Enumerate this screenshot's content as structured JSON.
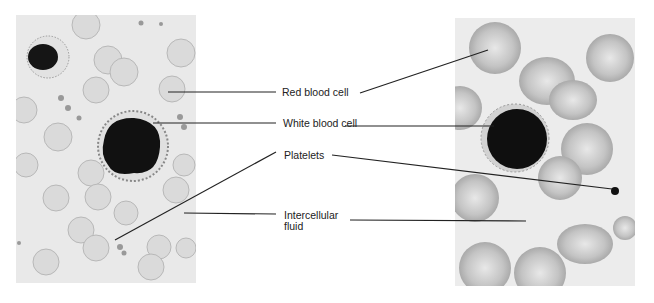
{
  "figure": {
    "left_panel": {
      "description": "Illustration of blood smear: red blood cells, white blood cell, platelets"
    },
    "right_panel": {
      "description": "Micrograph of blood smear: red blood cells, white blood cell, platelet"
    },
    "labels": [
      {
        "id": "red-blood-cell",
        "text": "Red blood cell"
      },
      {
        "id": "white-blood-cell",
        "text": "White blood cell"
      },
      {
        "id": "platelets",
        "text": "Platelets"
      },
      {
        "id": "intercellular-fluid",
        "text_line1": "Intercellular",
        "text_line2": "fluid"
      }
    ]
  },
  "colors": {
    "background": "#ffffff",
    "panel": "#e9e9e9",
    "rbc_fill": "#d6d6d6",
    "rbc_edge": "#b5b5b5",
    "nucleus": "#141414",
    "leader": "#222222"
  }
}
